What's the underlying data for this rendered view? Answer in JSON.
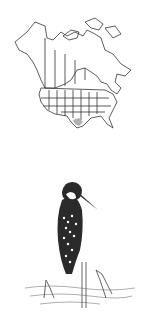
{
  "figure": {
    "range_map": {
      "subject": "North America outline map with state/province borders",
      "highlight_region": "south Texas",
      "highlight_color": "#b0b0b0",
      "line_color": "#333333"
    },
    "illustration": {
      "subject": "kingfisher perched on a stick above water",
      "style": "pencil sketch",
      "colors": {
        "dark": "#222222",
        "light": "#ffffff",
        "water": "#888888"
      }
    }
  }
}
